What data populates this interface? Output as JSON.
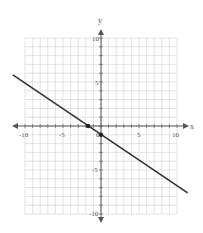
{
  "chart_data": {
    "type": "line",
    "title": "",
    "xlabel": "x",
    "ylabel": "y",
    "xlim": [
      -10,
      10
    ],
    "ylim": [
      -10,
      10
    ],
    "grid": true,
    "x_ticks": [
      -10,
      -5,
      0,
      5,
      10
    ],
    "y_ticks": [
      -10,
      -5,
      5,
      10
    ],
    "x_tick_labels": [
      "-10",
      "-5",
      "0",
      "5",
      "10"
    ],
    "y_tick_labels": [
      "10",
      "5",
      "-5",
      "-10"
    ],
    "series": [
      {
        "name": "line",
        "points": [
          [
            -11.6,
            5.8
          ],
          [
            11.4,
            -7.6
          ]
        ],
        "slope_estimate": -0.58,
        "marked_points": [
          [
            -1.7,
            0
          ],
          [
            0,
            -1
          ]
        ]
      }
    ],
    "legend": null
  },
  "labels": {
    "x_axis": "x",
    "y_axis": "y",
    "x_tick_neg10": "-10",
    "x_tick_neg5": "-5",
    "x_tick_0": "0",
    "x_tick_5": "5",
    "x_tick_10": "10",
    "y_tick_10": "10",
    "y_tick_5": "5",
    "y_tick_neg5": "-5",
    "y_tick_neg10": "-10"
  },
  "colors": {
    "grid": "#d0d0d0",
    "axis": "#555555",
    "line": "#333333",
    "point": "#222222"
  }
}
